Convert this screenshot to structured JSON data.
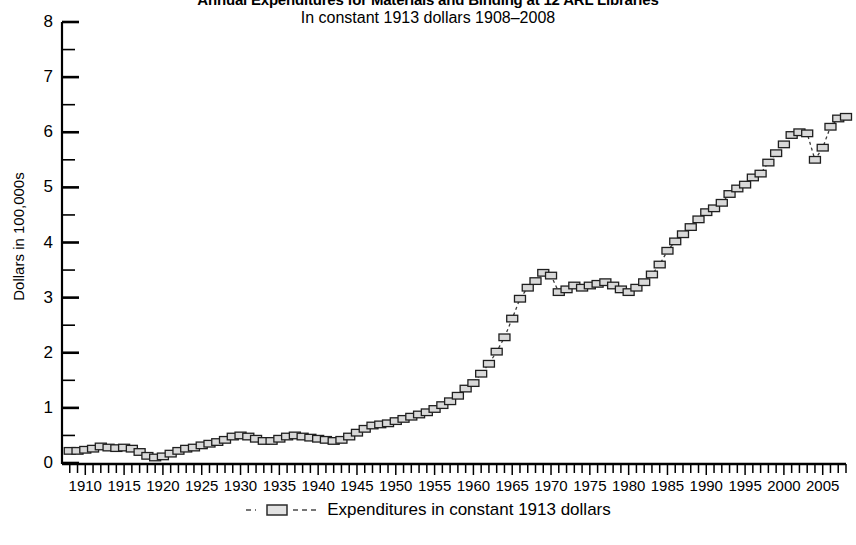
{
  "chart_data": {
    "type": "line",
    "title": "Annual Expenditures for Materials and Binding at 12 ARL Libraries",
    "subtitle": "In constant 1913 dollars 1908–2008",
    "xlabel": "",
    "ylabel": "Dollars in 100,000s",
    "xlim": [
      1907,
      2008
    ],
    "ylim": [
      0,
      8
    ],
    "grid": false,
    "legend_position": "bottom",
    "y_ticks_major": [
      0,
      1,
      2,
      3,
      4,
      5,
      6,
      7,
      8
    ],
    "y_ticks_minor_step": 0.5,
    "x_tick_labels": [
      1910,
      1915,
      1920,
      1925,
      1930,
      1935,
      1940,
      1945,
      1950,
      1955,
      1960,
      1965,
      1970,
      1975,
      1980,
      1985,
      1990,
      1995,
      2000,
      2005
    ],
    "x_tick_step_minor": 1,
    "series": [
      {
        "name": "Expenditures in constant 1913 dollars",
        "marker": "open-rectangle",
        "line_style": "dashed",
        "color": "#3b3b3b",
        "marker_fill": "#d9d9d9",
        "x": [
          1908,
          1909,
          1910,
          1911,
          1912,
          1913,
          1914,
          1915,
          1916,
          1917,
          1918,
          1919,
          1920,
          1921,
          1922,
          1923,
          1924,
          1925,
          1926,
          1927,
          1928,
          1929,
          1930,
          1931,
          1932,
          1933,
          1934,
          1935,
          1936,
          1937,
          1938,
          1939,
          1940,
          1941,
          1942,
          1943,
          1944,
          1945,
          1946,
          1947,
          1948,
          1949,
          1950,
          1951,
          1952,
          1953,
          1954,
          1955,
          1956,
          1957,
          1958,
          1959,
          1960,
          1961,
          1962,
          1963,
          1964,
          1965,
          1966,
          1967,
          1968,
          1969,
          1970,
          1971,
          1972,
          1973,
          1974,
          1975,
          1976,
          1977,
          1978,
          1979,
          1980,
          1981,
          1982,
          1983,
          1984,
          1985,
          1986,
          1987,
          1988,
          1989,
          1990,
          1991,
          1992,
          1993,
          1994,
          1995,
          1996,
          1997,
          1998,
          1999,
          2000,
          2001,
          2002,
          2003,
          2004,
          2005,
          2006,
          2007,
          2008
        ],
        "values": [
          0.22,
          0.22,
          0.24,
          0.26,
          0.3,
          0.28,
          0.27,
          0.28,
          0.26,
          0.2,
          0.13,
          0.1,
          0.12,
          0.17,
          0.22,
          0.26,
          0.28,
          0.32,
          0.35,
          0.38,
          0.42,
          0.48,
          0.5,
          0.48,
          0.44,
          0.4,
          0.4,
          0.44,
          0.48,
          0.5,
          0.48,
          0.46,
          0.44,
          0.42,
          0.4,
          0.42,
          0.48,
          0.55,
          0.62,
          0.68,
          0.7,
          0.72,
          0.76,
          0.8,
          0.84,
          0.88,
          0.92,
          0.98,
          1.05,
          1.12,
          1.22,
          1.35,
          1.45,
          1.62,
          1.8,
          2.02,
          2.28,
          2.62,
          2.98,
          3.18,
          3.3,
          3.45,
          3.4,
          3.1,
          3.15,
          3.22,
          3.18,
          3.22,
          3.25,
          3.28,
          3.22,
          3.15,
          3.1,
          3.18,
          3.28,
          3.42,
          3.6,
          3.85,
          4.02,
          4.15,
          4.28,
          4.42,
          4.55,
          4.62,
          4.72,
          4.88,
          4.98,
          5.05,
          5.18,
          5.25,
          5.45,
          5.62,
          5.78,
          5.95,
          6.0,
          5.98,
          5.5,
          5.72,
          6.1,
          6.25,
          6.28
        ]
      }
    ]
  }
}
